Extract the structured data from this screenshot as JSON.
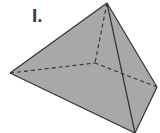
{
  "figure": {
    "label": "I.",
    "shape": "tetrahedron",
    "fill_color": "#a8a8a8",
    "edge_color": "#333333",
    "vertices": {
      "apex": [
        107,
        3
      ],
      "left": [
        10,
        73
      ],
      "right": [
        157,
        87
      ],
      "bottom": [
        135,
        133
      ],
      "hidden": [
        95,
        63
      ]
    },
    "visible_edges": [
      [
        "apex",
        "left"
      ],
      [
        "apex",
        "right"
      ],
      [
        "apex",
        "bottom"
      ],
      [
        "left",
        "bottom"
      ],
      [
        "right",
        "bottom"
      ]
    ],
    "hidden_edges": [
      [
        "apex",
        "hidden"
      ],
      [
        "left",
        "hidden"
      ],
      [
        "right",
        "hidden"
      ]
    ]
  }
}
